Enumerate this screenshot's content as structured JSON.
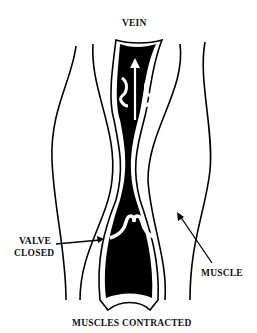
{
  "diagram": {
    "title_label": "VEIN",
    "labels": {
      "valve_line1": "VALVE",
      "valve_line2": "CLOSED",
      "muscle": "MUSCLE",
      "caption": "MUSCLES CONTRACTED"
    },
    "colors": {
      "ink": "#000000",
      "background": "#ffffff"
    },
    "elements": [
      "vein",
      "upper-valve-open",
      "lower-valve-closed",
      "blood-flow-arrow",
      "muscle-outline-left",
      "muscle-outline-right"
    ]
  }
}
